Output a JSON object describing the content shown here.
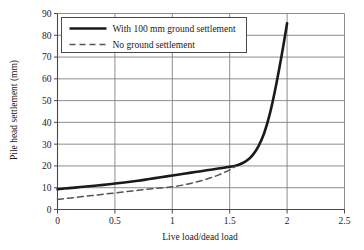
{
  "chart_data": {
    "type": "line",
    "title": "",
    "xlabel": "Live load/dead load",
    "ylabel": "Pile head settlement  (mm)",
    "xlim": [
      0,
      2.5
    ],
    "ylim": [
      0,
      90
    ],
    "xticks": [
      "0",
      "0.5",
      "1",
      "1.5",
      "2",
      "2.5"
    ],
    "xtick_values": [
      0,
      0.5,
      1,
      1.5,
      2,
      2.5
    ],
    "yticks": [
      "0",
      "10",
      "20",
      "30",
      "40",
      "50",
      "60",
      "70",
      "80",
      "90"
    ],
    "ytick_values": [
      0,
      10,
      20,
      30,
      40,
      50,
      60,
      70,
      80,
      90
    ],
    "grid": true,
    "grid_color": "#808080",
    "legend_position": "upper left",
    "series": [
      {
        "name": "With 100 mm ground settlement",
        "style": "solid",
        "color": "#1a1a1a",
        "width": 2.6,
        "x": [
          0.0,
          0.1,
          0.2,
          0.3,
          0.4,
          0.5,
          0.6,
          0.7,
          0.8,
          0.9,
          1.0,
          1.1,
          1.2,
          1.3,
          1.4,
          1.5,
          1.55,
          1.6,
          1.65,
          1.7,
          1.75,
          1.8,
          1.85,
          1.9,
          1.95,
          2.0
        ],
        "values": [
          9.3,
          9.8,
          10.3,
          10.8,
          11.3,
          11.9,
          12.5,
          13.2,
          14.0,
          14.8,
          15.6,
          16.4,
          17.2,
          18.0,
          18.8,
          19.6,
          20.1,
          21.0,
          22.5,
          25.0,
          29.0,
          35.0,
          44.0,
          56.0,
          70.0,
          85.5
        ]
      },
      {
        "name": "No ground settlement",
        "style": "dashed",
        "color": "#555555",
        "width": 1.5,
        "x": [
          0.0,
          0.1,
          0.2,
          0.3,
          0.4,
          0.5,
          0.6,
          0.7,
          0.8,
          0.9,
          1.0,
          1.1,
          1.2,
          1.3,
          1.4,
          1.5,
          1.55
        ],
        "values": [
          4.6,
          5.2,
          5.8,
          6.4,
          7.0,
          7.6,
          8.2,
          8.8,
          9.4,
          9.9,
          10.4,
          11.3,
          12.5,
          14.0,
          15.8,
          18.2,
          19.8
        ]
      }
    ]
  },
  "legend": {
    "entries": [
      {
        "label": "With 100 mm ground settlement",
        "style": "solid"
      },
      {
        "label": "No ground settlement",
        "style": "dashed"
      }
    ]
  },
  "axes": {
    "x_title": "Live load/dead load",
    "y_title": "Pile head settlement  (mm)"
  }
}
